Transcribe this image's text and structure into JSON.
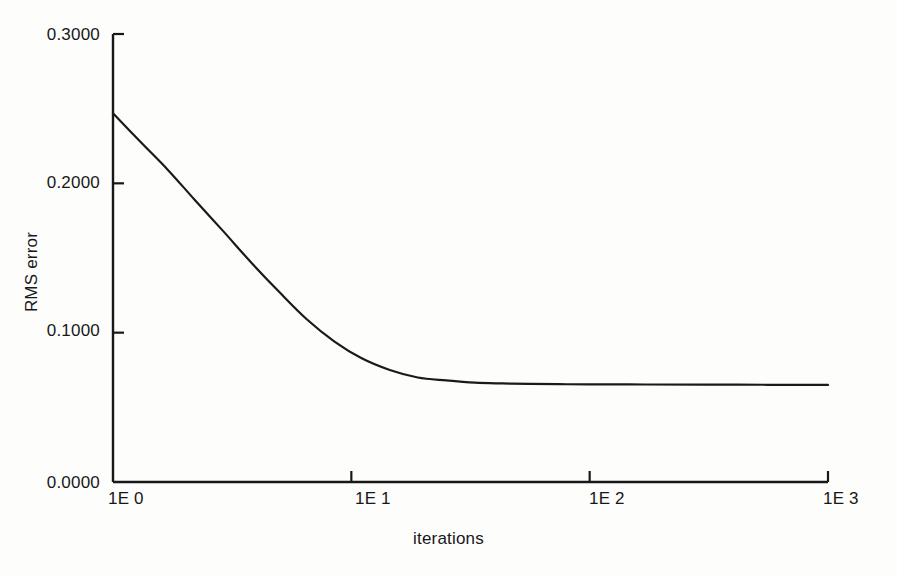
{
  "chart_data": {
    "type": "line",
    "title": "",
    "subtitle": "",
    "xlabel": "iterations",
    "ylabel": "RMS error",
    "xscale": "log",
    "yscale": "linear",
    "xlim": [
      1,
      1000
    ],
    "ylim": [
      0.0,
      0.3
    ],
    "grid": false,
    "legend": null,
    "xtick_labels": [
      "1E 0",
      "1E 1",
      "1E 2",
      "1E 3"
    ],
    "xtick_values": [
      1,
      10,
      100,
      1000
    ],
    "ytick_labels": [
      "0.3000",
      "0.2000",
      "0.1000",
      "0.0000"
    ],
    "ytick_values": [
      0.3,
      0.2,
      0.1,
      0.0
    ],
    "series": [
      {
        "name": "RMS error",
        "color": "#1a1a1a",
        "linewidth": 2.2,
        "x": [
          1,
          1.3,
          1.7,
          2.2,
          2.9,
          3.8,
          5.0,
          6.5,
          8.5,
          11,
          14.5,
          19,
          25,
          33,
          43,
          56,
          74,
          100,
          170,
          300,
          560,
          1000
        ],
        "values": [
          0.247,
          0.228,
          0.209,
          0.189,
          0.168,
          0.147,
          0.127,
          0.109,
          0.094,
          0.083,
          0.075,
          0.07,
          0.068,
          0.0665,
          0.066,
          0.0657,
          0.0655,
          0.0654,
          0.0653,
          0.0652,
          0.0651,
          0.065
        ]
      }
    ],
    "annotations": []
  },
  "axes": {
    "y_title": "RMS error",
    "x_title": "iterations",
    "y_ticks": [
      {
        "label": "0.3000",
        "value": 0.3
      },
      {
        "label": "0.2000",
        "value": 0.2
      },
      {
        "label": "0.1000",
        "value": 0.1
      },
      {
        "label": "0.0000",
        "value": 0.0
      }
    ],
    "x_ticks": [
      {
        "label": "1E 0",
        "value": 1
      },
      {
        "label": "1E 1",
        "value": 10
      },
      {
        "label": "1E 2",
        "value": 100
      },
      {
        "label": "1E 3",
        "value": 1000
      }
    ]
  },
  "style": {
    "background": "#fdfdfb",
    "axis_color": "#18181a",
    "line_color": "#1a1a1a",
    "text_color": "#18181a"
  }
}
